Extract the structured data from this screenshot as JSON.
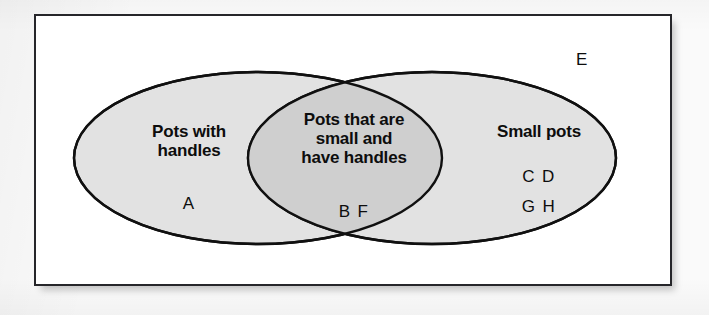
{
  "diagram": {
    "type": "venn-two-set",
    "universe": {
      "label": "E",
      "description": "Universal set rectangle containing both ellipses"
    },
    "sets": [
      {
        "id": "left",
        "title": "Pots with\nhandles",
        "members": "A",
        "fill": "#e2e2e2"
      },
      {
        "id": "right",
        "title": "Small pots",
        "members": "C D\nG H",
        "fill": "#e2e2e2"
      }
    ],
    "intersection": {
      "id": "center",
      "title": "Pots that are\nsmall and\nhave handles",
      "members": "B F",
      "fill": "#cfcfcf"
    },
    "colors": {
      "outline": "#101010",
      "frame_border": "#26262a",
      "frame_background": "#ffffff",
      "page_background": "#fafafa",
      "text": "#0d0d0d"
    }
  }
}
